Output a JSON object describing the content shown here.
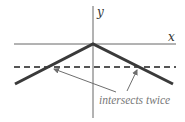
{
  "diagram": {
    "axes": {
      "x_label": "x",
      "y_label": "y"
    },
    "annotation": "intersects twice",
    "colors": {
      "axis": "#555555",
      "graph": "#3a3a3a",
      "dashed": "#555555",
      "arrow": "#6e6e6e",
      "annotation": "#777777"
    }
  }
}
